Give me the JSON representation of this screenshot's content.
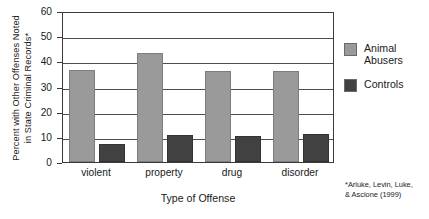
{
  "chart_data": {
    "type": "bar",
    "title": "",
    "categories": [
      "violent",
      "property",
      "drug",
      "disorder"
    ],
    "series": [
      {
        "name": "Animal\nAbusers",
        "legend_label": "Animal\nAbusers",
        "color": "#9a9a9a",
        "values": [
          36.5,
          43.5,
          36.0,
          36.0
        ]
      },
      {
        "name": "Controls",
        "legend_label": "Controls",
        "color": "#414141",
        "values": [
          7.0,
          10.7,
          10.4,
          11.2
        ]
      }
    ],
    "xlabel": "Type of Offense",
    "ylabel": "Percent with Other Offenses Noted\nin State Criminal Records*",
    "ylim": [
      0,
      60
    ],
    "yticks": [
      0,
      10,
      20,
      30,
      40,
      50,
      60
    ],
    "ytick_labels": [
      "0",
      "10",
      "20",
      "30",
      "40",
      "50",
      "60"
    ],
    "grid": "horizontal",
    "legend_position": "right",
    "footnote": "*Arluke, Levin, Luke,\n& Ascione (1999)"
  },
  "legend": {
    "items": [
      {
        "label": "Animal\nAbusers",
        "color": "#9a9a9a"
      },
      {
        "label": "Controls",
        "color": "#414141"
      }
    ]
  },
  "axes": {
    "ylabel": "Percent with Other Offenses Noted\nin State Criminal Records*",
    "xlabel": "Type of Offense"
  },
  "footnote": "*Arluke, Levin, Luke,\n& Ascione (1999)"
}
